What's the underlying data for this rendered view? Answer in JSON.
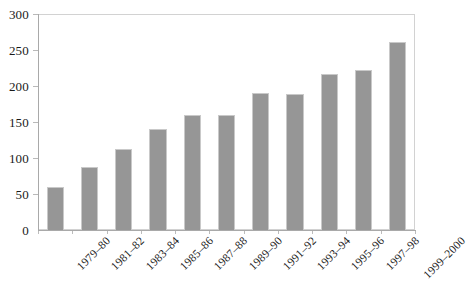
{
  "chart_data": {
    "type": "bar",
    "title": "",
    "subtitle": "",
    "xlabel": "",
    "ylabel": "",
    "categories": [
      "1979–80",
      "1981–82",
      "1983–84",
      "1985–86",
      "1987–88",
      "1989–90",
      "1991–92",
      "1993–94",
      "1995–96",
      "1997–98",
      "1999–2000"
    ],
    "values": [
      60,
      88,
      113,
      140,
      160,
      160,
      190,
      189,
      217,
      222,
      261
    ],
    "ylim": [
      0,
      300
    ],
    "y_ticks": [
      0,
      50,
      100,
      150,
      200,
      250,
      300
    ],
    "y_tick_labels": [
      "0",
      "50",
      "100",
      "150",
      "200",
      "250",
      "300"
    ],
    "grid": false,
    "legend": false,
    "legend_position": "none",
    "bar_color": "#969696",
    "bar_border_color": "#c9c9c9",
    "axis_color": "#a9a9a9",
    "plot_border_color": "#d2d2d2",
    "background_color": "#ffffff",
    "text_color": "#1a1a1a",
    "x_label_rotation": -45
  }
}
